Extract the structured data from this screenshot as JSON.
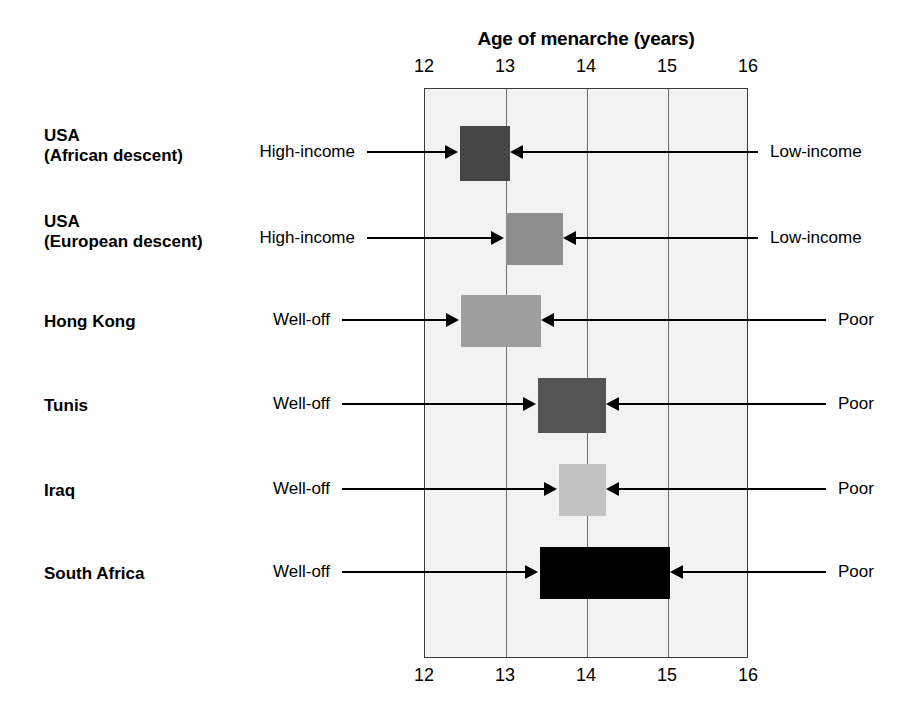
{
  "chart_data": {
    "type": "bar",
    "title": "Age of menarche (years)",
    "xlabel": "Age of menarche (years)",
    "ylabel": "",
    "xlim": [
      12,
      16
    ],
    "xticks": [
      12,
      13,
      14,
      15,
      16
    ],
    "xtick_labels": [
      "12",
      "13",
      "14",
      "15",
      "16"
    ],
    "grid": true,
    "legend": "none",
    "axis_label_positions": [
      "top",
      "bottom"
    ],
    "orientation": "horizontal",
    "note": "Each bar is a range of mean age of menarche spanning from the high-income/well-off group (left end) to the low-income/poor group (right end).",
    "categories": [
      "USA (African descent)",
      "USA (European descent)",
      "Hong Kong",
      "Tunis",
      "Iraq",
      "South Africa"
    ],
    "series": [
      {
        "name": "Age of menarche range",
        "ranges": [
          {
            "category": "USA (African descent)",
            "start": 12.43,
            "end": 13.05,
            "color": "#454545"
          },
          {
            "category": "USA (European descent)",
            "start": 13.0,
            "end": 13.7,
            "color": "#8f8f8f"
          },
          {
            "category": "Hong Kong",
            "start": 12.45,
            "end": 13.43,
            "color": "#9e9e9e"
          },
          {
            "category": "Tunis",
            "start": 13.4,
            "end": 14.23,
            "color": "#545454"
          },
          {
            "category": "Iraq",
            "start": 13.65,
            "end": 14.23,
            "color": "#c2c2c2"
          },
          {
            "category": "South Africa",
            "start": 13.42,
            "end": 15.02,
            "color": "#000000"
          }
        ]
      }
    ]
  },
  "rows": [
    {
      "id": "usa-african-descent",
      "label": "USA\n(African descent)",
      "left_annotation": "High-income",
      "right_annotation": "Low-income"
    },
    {
      "id": "usa-european-descent",
      "label": "USA\n(European descent)",
      "left_annotation": "High-income",
      "right_annotation": "Low-income"
    },
    {
      "id": "hong-kong",
      "label": "Hong Kong",
      "left_annotation": "Well-off",
      "right_annotation": "Poor"
    },
    {
      "id": "tunis",
      "label": "Tunis",
      "left_annotation": "Well-off",
      "right_annotation": "Poor"
    },
    {
      "id": "iraq",
      "label": "Iraq",
      "left_annotation": "Well-off",
      "right_annotation": "Poor"
    },
    {
      "id": "south-africa",
      "label": "South Africa",
      "left_annotation": "Well-off",
      "right_annotation": "Poor"
    }
  ],
  "colors": {
    "plot_background": "#f2f2f2",
    "frame": "#3b3b3b",
    "gridline": "#6e6e6e",
    "text": "#000000",
    "arrow": "#000000"
  }
}
